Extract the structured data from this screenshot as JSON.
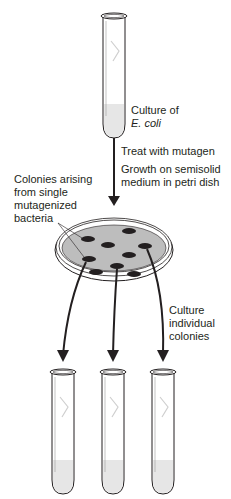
{
  "labels": {
    "culture_line1": "Culture of",
    "culture_line2": "E. coli",
    "treat": "Treat with mutagen",
    "growth_line1": "Growth on semisolid",
    "growth_line2": "medium in petri dish",
    "colonies_line1": "Colonies arising",
    "colonies_line2": "from single",
    "colonies_line3": "mutagenized",
    "colonies_line4": "bacteria",
    "culture_ind_line1": "Culture",
    "culture_ind_line2": "individual",
    "culture_ind_line3": "colonies"
  },
  "colors": {
    "ink": "#231f20",
    "agar": "#bdbdbd",
    "liquid": "#e6e6e6"
  }
}
